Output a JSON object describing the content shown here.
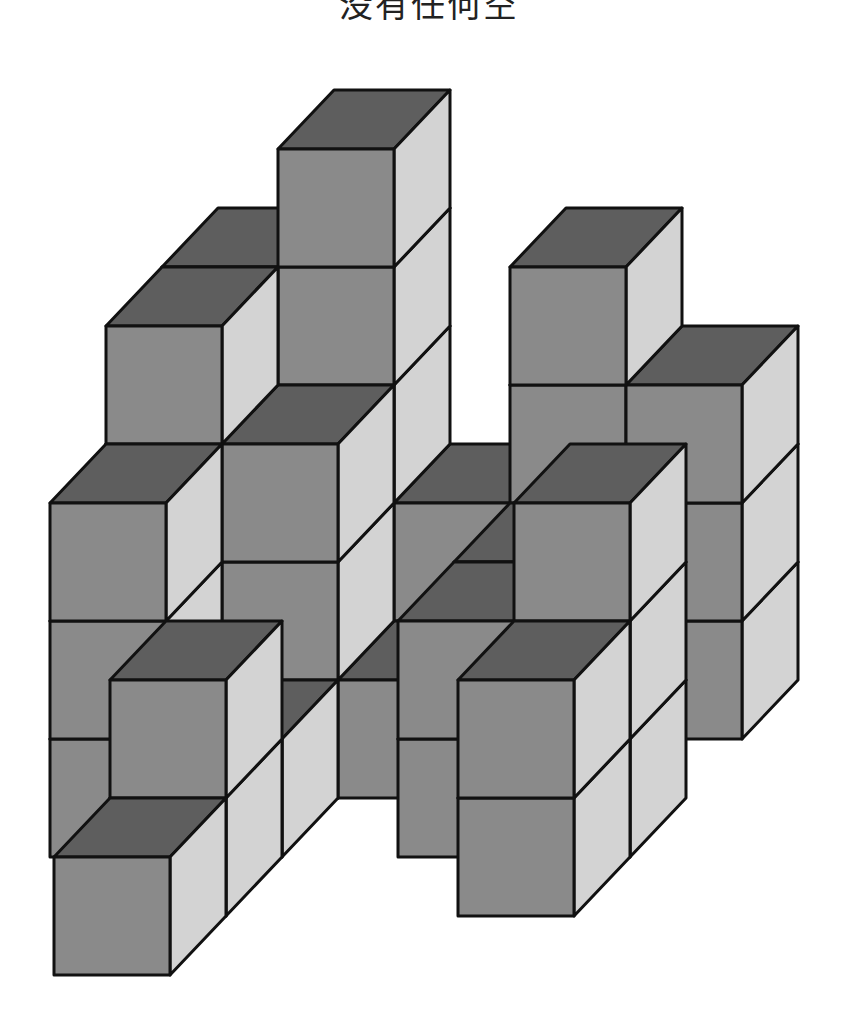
{
  "caption": {
    "text": "没有任何空"
  },
  "figure": {
    "projection": {
      "origin_x": -62,
      "origin_y": 975,
      "unit_w": 116,
      "unit_h": 118,
      "depth_dx": 56,
      "depth_dy": -59
    },
    "colors": {
      "front": "#8a8a8a",
      "top": "#5e5e5e",
      "side": "#d3d3d3",
      "edge": "#111111",
      "background": "#ffffff"
    },
    "columns": [
      {
        "c": 0,
        "d": 2,
        "height": 3
      },
      {
        "c": 0,
        "d": 3,
        "height": 4
      },
      {
        "c": 0,
        "d": 4,
        "height": 4
      },
      {
        "c": 1,
        "d": 0,
        "height": 1
      },
      {
        "c": 1,
        "d": 1,
        "height": 2
      },
      {
        "c": 1,
        "d": 2,
        "height": 1
      },
      {
        "c": 1,
        "d": 3,
        "height": 3
      },
      {
        "c": 1,
        "d": 4,
        "height": 5
      },
      {
        "c": 2,
        "d": 3,
        "height": 1
      },
      {
        "c": 2,
        "d": 4,
        "height": 2
      },
      {
        "c": 3,
        "d": 2,
        "height": 2
      },
      {
        "c": 3,
        "d": 3,
        "height": 2
      },
      {
        "c": 3,
        "d": 4,
        "height": 4
      },
      {
        "c": 4,
        "d": 1,
        "height": 2
      },
      {
        "c": 4,
        "d": 2,
        "height": 3
      },
      {
        "c": 4,
        "d": 4,
        "height": 3
      }
    ]
  }
}
